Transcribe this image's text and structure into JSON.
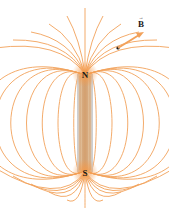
{
  "diagram": {
    "colors": {
      "field_line": "#f2a15a",
      "pole_glow": "#f7a860",
      "magnet_body": "#d9b48c",
      "magnet_edge": "#b8c4d6",
      "point": "#111111",
      "arrow": "#f2a15a"
    },
    "north_label": "N",
    "south_label": "S",
    "vector_label": "B",
    "vector_accent": "→",
    "field_line_count_per_side": 11,
    "field_direction": "out of N, into S"
  }
}
